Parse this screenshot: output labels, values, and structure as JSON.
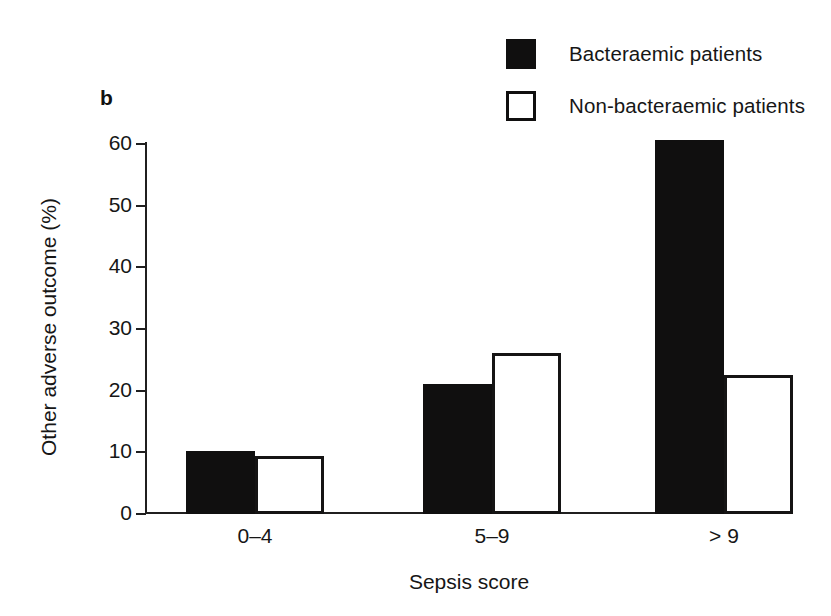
{
  "panel": {
    "letter": "b"
  },
  "legend": {
    "position": "top-right",
    "entries": [
      {
        "label": "Bacteraemic patients",
        "swatch": "filled-square-icon",
        "color": "#100f0f"
      },
      {
        "label": "Non-bacteraemic patients",
        "swatch": "open-square-icon",
        "color": "#ffffff"
      }
    ]
  },
  "chart_data": {
    "type": "bar",
    "title": "",
    "subtitle": "",
    "panel_label": "b",
    "categories": [
      "0–4",
      "5–9",
      "> 9"
    ],
    "series": [
      {
        "name": "Bacteraemic patients",
        "values": [
          10,
          21,
          60.5
        ],
        "fill": "#100f0f"
      },
      {
        "name": "Non-bacteraemic patients",
        "values": [
          9.2,
          26,
          22.3
        ],
        "fill": "#ffffff"
      }
    ],
    "xlabel": "Sepsis score",
    "ylabel": "Other adverse outcome (%)",
    "ylim": [
      0,
      60
    ],
    "yticks": [
      0,
      10,
      20,
      30,
      40,
      50,
      60
    ],
    "ytick_labels": [
      "0",
      "10",
      "20",
      "30",
      "40",
      "50",
      "60"
    ],
    "grid": false,
    "legend_position": "top-right",
    "annotations": []
  }
}
